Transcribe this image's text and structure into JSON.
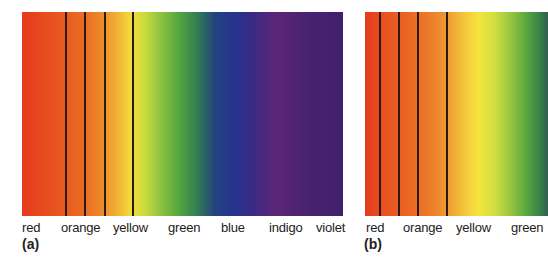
{
  "panels": [
    {
      "tag": "(a)",
      "labels": [
        "red",
        "orange",
        "yellow",
        "green",
        "blue",
        "indigo",
        "violet"
      ],
      "divider_count": 4
    },
    {
      "tag": "(b)",
      "labels": [
        "red",
        "orange",
        "yellow",
        "green"
      ],
      "divider_count": 4
    }
  ],
  "colors": {
    "red": "#e63a1e",
    "orange": "#ec7a28",
    "yellow": "#f3dc3a",
    "green": "#53a540",
    "blue": "#253490",
    "indigo": "#3a2a84",
    "violet": "#4b236f",
    "divider": "#2a1a12"
  }
}
